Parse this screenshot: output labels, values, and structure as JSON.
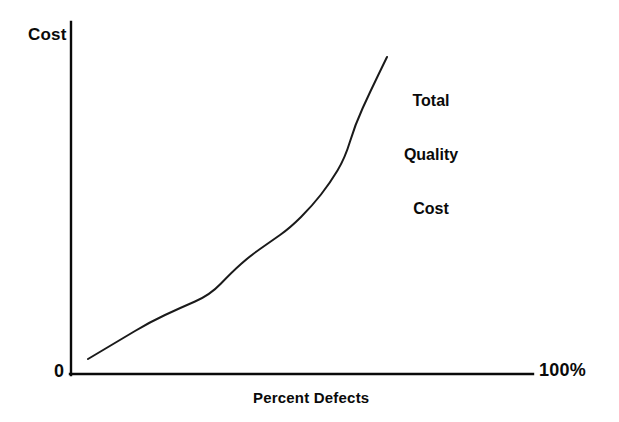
{
  "chart_data": {
    "type": "line",
    "title": "",
    "subtitle": "",
    "xlabel": "Percent Defects",
    "ylabel": "Cost",
    "xlim": [
      0,
      100
    ],
    "ylim": [
      0,
      100
    ],
    "grid": false,
    "legend_position": "inline-annotation",
    "axis_origin_label": "0",
    "x_axis_max_label": "100%",
    "axes": {
      "x_tick_labels": [
        "0",
        "100%"
      ],
      "y_tick_labels": [
        "0"
      ],
      "arrowheads": false,
      "line_color": "#0a0a0a"
    },
    "annotations": [
      {
        "name": "total-quality-cost",
        "lines": [
          "Total",
          "Quality",
          "Cost"
        ],
        "x": 88,
        "y": 86
      }
    ],
    "series": [
      {
        "name": "Total Quality Cost",
        "color": "#1a1a1a",
        "x": [
          4,
          16,
          23,
          28,
          34,
          40,
          46,
          52,
          57,
          62,
          65,
          68
        ],
        "y": [
          5,
          15,
          22,
          26,
          34,
          42,
          48,
          56,
          68,
          80,
          88,
          100
        ],
        "points_px": [
          [
            88,
            359
          ],
          [
            120,
            340
          ],
          [
            150,
            322
          ],
          [
            180,
            308
          ],
          [
            210,
            295
          ],
          [
            232,
            272
          ],
          [
            250,
            256
          ],
          [
            270,
            242
          ],
          [
            290,
            228
          ],
          [
            312,
            206
          ],
          [
            330,
            183
          ],
          [
            345,
            158
          ],
          [
            355,
            125
          ],
          [
            370,
            92
          ],
          [
            387,
            57
          ]
        ]
      }
    ]
  },
  "figure": {
    "background_color": "#ffffff",
    "ink_color": "#0a0a0a"
  }
}
